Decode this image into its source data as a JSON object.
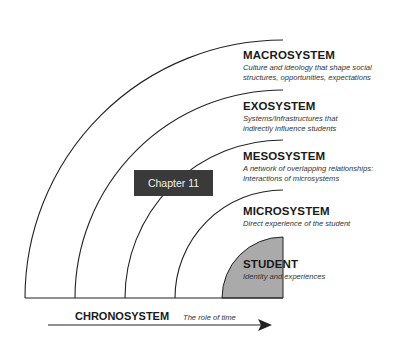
{
  "layers": [
    {
      "title": "MACROSYSTEM",
      "description_line1": "Culture and ideology that shape social",
      "description_line2": "structures, opportunities, expectations"
    },
    {
      "title": "EXOSYSTEM",
      "description_line1": "Systems/Infrastructures that",
      "description_line2": "indirectly influence students"
    },
    {
      "title": "MESOSYSTEM",
      "description_line1": "A network of overlapping relationships:",
      "description_line2": "Interactions of microsystems"
    },
    {
      "title": "MICROSYSTEM",
      "description_line1": "Direct experience of the student",
      "description_line2": ""
    },
    {
      "title": "STUDENT",
      "description_line1": "Identity and experiences",
      "description_line2": ""
    }
  ],
  "chapter_label": "Chapter 11",
  "chronosystem": {
    "title": "CHRONOSYSTEM",
    "description": "The role of time"
  },
  "colors": {
    "student_fill": "#aaaaaa",
    "chapter_bg": "#3a3a3a",
    "line": "#222222"
  }
}
